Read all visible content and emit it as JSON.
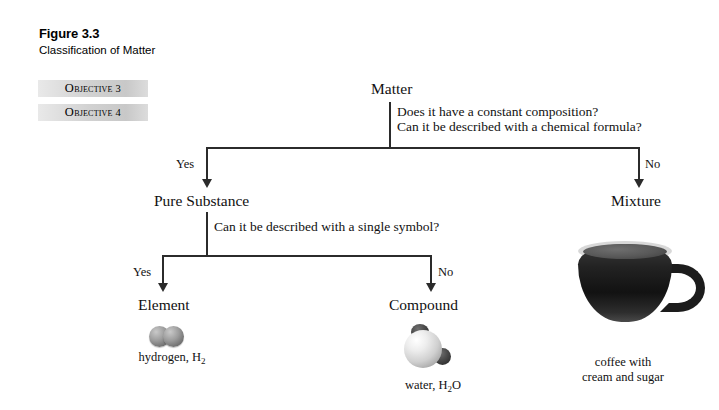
{
  "figure": {
    "number": "Figure 3.3",
    "title": "Classification of Matter"
  },
  "objectives": [
    {
      "prefix": "O",
      "rest": "bjective",
      "number": "3"
    },
    {
      "prefix": "O",
      "rest": "bjective",
      "number": "4"
    }
  ],
  "flowchart": {
    "type": "decision-tree",
    "root": "Matter",
    "questions": {
      "level1_line1": "Does it have a constant composition?",
      "level1_line2": "Can it be described with a chemical formula?",
      "level2": "Can it be described with a single symbol?"
    },
    "labels": {
      "yes1": "Yes",
      "no1": "No",
      "yes2": "Yes",
      "no2": "No"
    },
    "nodes": {
      "pure_substance": "Pure Substance",
      "mixture": "Mixture",
      "element": "Element",
      "compound": "Compound"
    },
    "examples": {
      "element": {
        "name": "hydrogen, H",
        "formula_sub": "2",
        "molecule": "two-gray-spheres"
      },
      "compound": {
        "name": "water, H",
        "formula_sub": "2",
        "formula_tail": "O",
        "molecule": "one-large-light-sphere-two-small-dark-spheres"
      },
      "mixture": {
        "line1": "coffee with",
        "line2": "cream and sugar",
        "image": "coffee-cup"
      }
    }
  },
  "colors": {
    "background": "#ffffff",
    "line": "#2b2b2b",
    "text": "#111111",
    "objective_chip_light": "#e9e9e9",
    "objective_chip_dark": "#c8c8c8"
  }
}
